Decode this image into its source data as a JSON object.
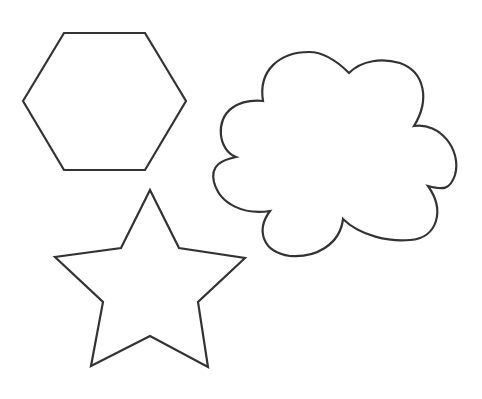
{
  "canvas": {
    "width": 482,
    "height": 399,
    "background": "#ffffff"
  },
  "stroke_color": "#333333",
  "shapes": [
    {
      "name": "hexagon",
      "points": "23,101 64,33 145,33 186,101 145,170 64,170"
    },
    {
      "name": "cloud"
    },
    {
      "name": "star",
      "points": "150,190 179,248 245,258 198,302 208,367 150,336 91,366 103,302 55,257 121,248"
    }
  ]
}
